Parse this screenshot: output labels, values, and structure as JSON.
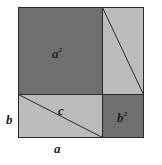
{
  "diagram": {
    "colors": {
      "dark": "#6f6f6f",
      "light": "#bcbcbc",
      "line": "#2a2a2a"
    },
    "labels": {
      "a_squared": {
        "base": "a",
        "exp": "2"
      },
      "b_squared": {
        "base": "b",
        "exp": "2"
      },
      "hypotenuse": "c",
      "side_b": "b",
      "side_a": "a"
    }
  }
}
